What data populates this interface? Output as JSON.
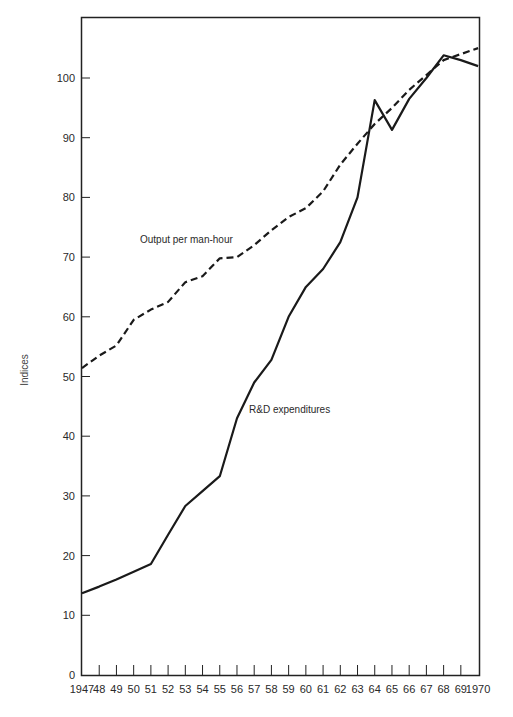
{
  "chart_data": {
    "type": "line",
    "title": "",
    "xlabel": "",
    "ylabel": "Indices",
    "ylim": [
      0,
      108
    ],
    "xlim": [
      1947,
      1970
    ],
    "grid": false,
    "legend_position": "inline",
    "x": [
      1947,
      1948,
      1949,
      1950,
      1951,
      1952,
      1953,
      1954,
      1955,
      1956,
      1957,
      1958,
      1959,
      1960,
      1961,
      1962,
      1963,
      1964,
      1965,
      1966,
      1967,
      1968,
      1969,
      1970
    ],
    "x_tick_labels": [
      "1947",
      "48",
      "49",
      "50",
      "51",
      "52",
      "53",
      "54",
      "55",
      "56",
      "57",
      "58",
      "59",
      "60",
      "61",
      "62",
      "63",
      "64",
      "65",
      "66",
      "67",
      "68",
      "69",
      "1970"
    ],
    "y_ticks": [
      0,
      10,
      20,
      30,
      40,
      50,
      60,
      70,
      80,
      90,
      100
    ],
    "series": [
      {
        "name": "Output per man-hour",
        "style": "dashed",
        "values": [
          51.4,
          53.5,
          55.2,
          59.5,
          61.2,
          62.5,
          65.8,
          66.8,
          69.8,
          70.0,
          72.0,
          74.5,
          76.7,
          78.2,
          81.0,
          85.5,
          89.0,
          92.3,
          95.0,
          98.0,
          100.5,
          103.0,
          104.0,
          105.0
        ],
        "label_position": {
          "x": 140,
          "y": 243
        }
      },
      {
        "name": "R&D expenditures",
        "style": "solid",
        "values": [
          13.7,
          14.8,
          16.0,
          17.3,
          18.6,
          23.5,
          28.3,
          30.8,
          33.3,
          43.0,
          49.0,
          52.8,
          60.0,
          65.0,
          68.0,
          72.5,
          80.0,
          96.3,
          91.3,
          96.5,
          100.0,
          103.8,
          103.0,
          102.0
        ],
        "label_position": {
          "x": 249,
          "y": 413
        }
      }
    ]
  }
}
